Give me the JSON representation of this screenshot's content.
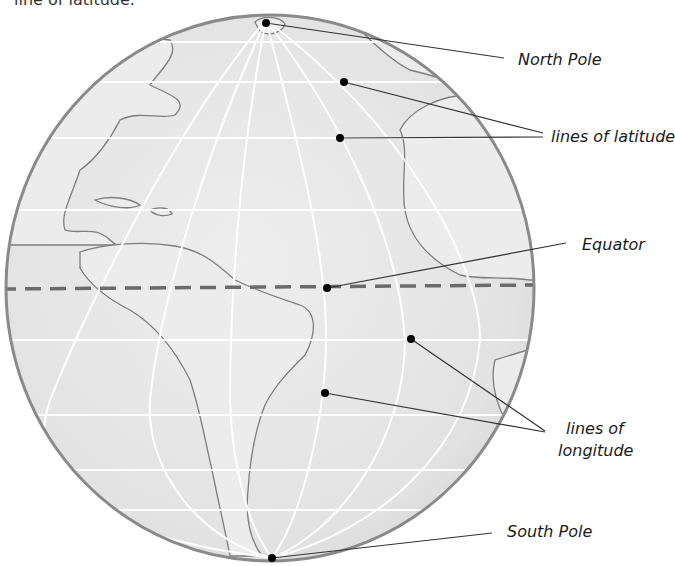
{
  "caption_fragment": "line of latitude.",
  "globe": {
    "fill_color": "#e3e3e3",
    "land_fill_color": "#ebebeb",
    "outline_color": "#8a8a8a",
    "coast_color": "#7a7a7a",
    "grid_color": "#ffffff",
    "equator_color": "#6e6e6e"
  },
  "labels": {
    "north_pole": "North Pole",
    "lines_of_latitude": "lines of latitude",
    "equator": "Equator",
    "lines_of_longitude_1": "lines of",
    "lines_of_longitude_2": "longitude",
    "south_pole": "South Pole"
  },
  "points": {
    "north_pole": [
      266,
      23
    ],
    "latitude_1": [
      344,
      82
    ],
    "latitude_2": [
      340,
      138
    ],
    "equator": [
      327,
      288
    ],
    "longitude_1": [
      411,
      339
    ],
    "longitude_2": [
      325,
      393
    ],
    "south_pole": [
      272,
      558
    ]
  }
}
